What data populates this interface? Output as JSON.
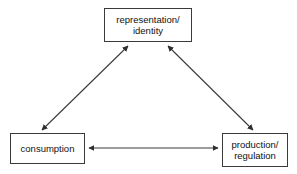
{
  "diagram": {
    "background_color": "#ffffff",
    "line_color": "#3a3a3a",
    "text_color": "#111111",
    "nodes": [
      {
        "id": "representation",
        "label": "representation/\nidentity",
        "lines": [
          "representation/",
          "identity"
        ],
        "position": "top-center"
      },
      {
        "id": "consumption",
        "label": "consumption",
        "lines": [
          "consumption"
        ],
        "position": "bottom-left"
      },
      {
        "id": "production",
        "label": "production/\nregulation",
        "lines": [
          "production/",
          "regulation"
        ],
        "position": "bottom-right"
      }
    ],
    "edges": [
      {
        "id": "consumption-representation",
        "from": "consumption",
        "to": "representation",
        "style": "double-arrow"
      },
      {
        "id": "production-representation",
        "from": "production",
        "to": "representation",
        "style": "double-arrow"
      },
      {
        "id": "consumption-production",
        "from": "consumption",
        "to": "production",
        "style": "double-arrow"
      }
    ]
  }
}
